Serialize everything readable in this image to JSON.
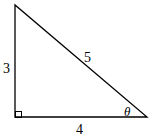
{
  "diagram": {
    "type": "right-triangle",
    "sides": {
      "vertical": "3",
      "hypotenuse": "5",
      "horizontal": "4"
    },
    "angle_label": "θ",
    "right_angle_marker": true,
    "colors": {
      "stroke": "#000000",
      "background": "#ffffff"
    }
  }
}
